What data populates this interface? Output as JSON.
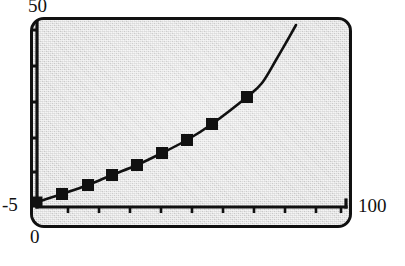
{
  "chart_data": {
    "type": "line",
    "title": "",
    "subtitle": "",
    "xlabel": "",
    "ylabel": "",
    "xlim": [
      0,
      100
    ],
    "ylim": [
      -5,
      50
    ],
    "grid": false,
    "legend": null,
    "axis_style": "L-shaped axes with tick marks, no tick number labels except range endpoints",
    "x_tick_count": 10,
    "x_tick_interval": 10,
    "y_tick_count": 6,
    "marker_shape": "square",
    "marker_color": "#111111",
    "line_color": "#111111",
    "plot_background": "#d9d9d9",
    "frame_color": "#111111",
    "series": [
      {
        "name": "curve",
        "marked_points": [
          {
            "x": 0,
            "y": -3.2
          },
          {
            "x": 8,
            "y": -1.5
          },
          {
            "x": 16,
            "y": 0.5
          },
          {
            "x": 24,
            "y": 2.6
          },
          {
            "x": 32,
            "y": 4.8
          },
          {
            "x": 40,
            "y": 7.4
          },
          {
            "x": 48,
            "y": 10.3
          },
          {
            "x": 56,
            "y": 13.8
          },
          {
            "x": 68,
            "y": 21.4
          }
        ],
        "unmarked_tail": [
          {
            "x": 76,
            "y": 27.0
          },
          {
            "x": 84,
            "y": 34.0
          },
          {
            "x": 92,
            "y": 41.5
          },
          {
            "x": 99,
            "y": 48.2
          }
        ]
      }
    ]
  },
  "axes": {
    "y_max_label": "50",
    "y_min_label": "-5",
    "x_min_label": "0",
    "x_max_label": "100"
  },
  "geometry": {
    "frame": {
      "x": 30,
      "y": 17,
      "w": 322,
      "h": 211,
      "radius": 14
    },
    "y_axis": {
      "x": 37,
      "y_top": 22,
      "y_bottom": 207
    },
    "x_axis": {
      "y": 207,
      "x_left": 37,
      "x_right": 346
    },
    "y_ticks_px": [
      30,
      66,
      102,
      138,
      172,
      200
    ],
    "x_ticks_px": [
      68,
      99,
      130,
      161,
      192,
      223,
      254,
      285,
      316,
      341
    ],
    "marker_px": [
      {
        "x": 37,
        "y": 202
      },
      {
        "x": 62,
        "y": 194
      },
      {
        "x": 88,
        "y": 185
      },
      {
        "x": 112,
        "y": 175
      },
      {
        "x": 137,
        "y": 165
      },
      {
        "x": 162,
        "y": 153
      },
      {
        "x": 187,
        "y": 140
      },
      {
        "x": 212,
        "y": 124
      },
      {
        "x": 247,
        "y": 97
      }
    ],
    "curve_end_px": {
      "x": 296,
      "y": 25
    }
  }
}
